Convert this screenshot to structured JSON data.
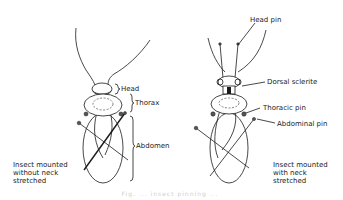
{
  "figure": {
    "left_insect": {
      "labels": {
        "head": "Head",
        "thorax": "Thorax",
        "abdomen": "Abdomen"
      },
      "caption": "Insect mounted\nwithout neck\nstretched"
    },
    "right_insect": {
      "labels": {
        "head_pin": "Head pin",
        "dorsal_sclerite": "Dorsal sclerite",
        "thoracic_pin": "Thoracic pin",
        "abdominal_pin": "Abdominal pin"
      },
      "caption": "Insect mounted\nwith neck\nstretched"
    },
    "figure_caption": "Fig. ... insect pinning ..."
  },
  "colors": {
    "line": "#1a1a1a",
    "text": "#222222",
    "background": "#ffffff"
  }
}
